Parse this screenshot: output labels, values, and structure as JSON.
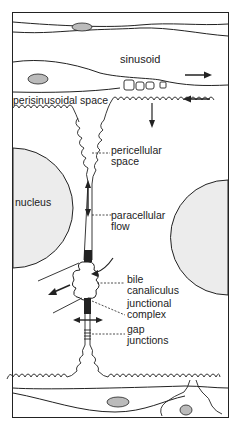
{
  "diagram": {
    "labels": {
      "sinusoid": "sinusoid",
      "perisinusoidal_space": "perisinusoidal space",
      "pericellular_space_1": "pericellular",
      "pericellular_space_2": "space",
      "nucleus": "nucleus",
      "paracellular_flow_1": "paracellular",
      "paracellular_flow_2": "flow",
      "bile_canaliculus_1": "bile",
      "bile_canaliculus_2": "canaliculus",
      "junctional_complex_1": "junctional",
      "junctional_complex_2": "complex",
      "gap_junctions_1": "gap",
      "gap_junctions_2": "junctions"
    },
    "colors": {
      "line": "#222222",
      "nucleus_fill": "#ececec",
      "background": "#ffffff"
    }
  }
}
